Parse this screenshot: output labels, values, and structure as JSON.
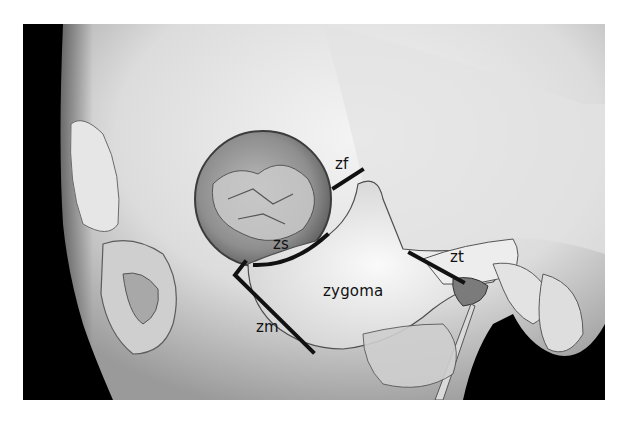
{
  "figure": {
    "background_color": "#000000",
    "bone_color": "#e8e8e8",
    "annotation_color": "#111111",
    "labels": {
      "zf": "zf",
      "zs": "zs",
      "zt": "zt",
      "zm": "zm",
      "zygoma": "zygoma"
    }
  }
}
